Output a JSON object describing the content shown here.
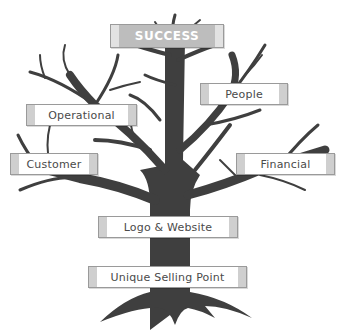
{
  "diagram": {
    "type": "tree-metaphor",
    "colors": {
      "tree": "#3f3f3f",
      "box_border": "#9a9a9a",
      "box_fill": "#ffffff",
      "box_cap": "#cfcfcf",
      "success_fill": "#bdbdbd",
      "success_text": "#ffffff",
      "label_text": "#4a4a4a"
    },
    "top": {
      "label": "SUCCESS"
    },
    "branches": [
      {
        "id": "people",
        "label": "People"
      },
      {
        "id": "operational",
        "label": "Operational"
      },
      {
        "id": "customer",
        "label": "Customer"
      },
      {
        "id": "financial",
        "label": "Financial"
      }
    ],
    "trunk": {
      "label": "Logo & Website"
    },
    "roots": {
      "label": "Unique Selling Point"
    }
  }
}
